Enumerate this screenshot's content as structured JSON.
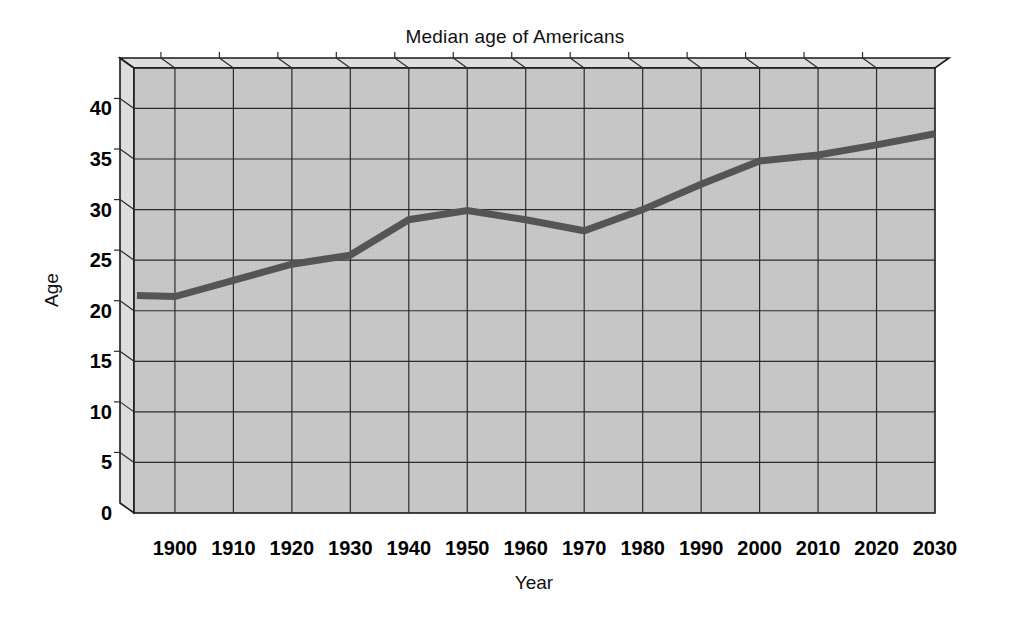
{
  "chart_data": {
    "type": "line",
    "title": "Median age of Americans",
    "xlabel": "Year",
    "ylabel": "Age",
    "categories": [
      1900,
      1910,
      1920,
      1930,
      1940,
      1950,
      1960,
      1970,
      1980,
      1990,
      2000,
      2010,
      2020,
      2030
    ],
    "values": [
      21.4,
      23.0,
      24.6,
      25.5,
      29.0,
      29.9,
      29.0,
      27.9,
      30.0,
      32.5,
      34.8,
      35.4,
      36.4,
      37.5
    ],
    "lead_in": {
      "x": 1893,
      "y": 21.5
    },
    "series": [
      {
        "name": "Median age",
        "values": [
          21.4,
          23.0,
          24.6,
          25.5,
          29.0,
          29.9,
          29.0,
          27.9,
          30.0,
          32.5,
          34.8,
          35.4,
          36.4,
          37.5
        ]
      }
    ],
    "xticklabels": [
      "1900",
      "1910",
      "1920",
      "1930",
      "1940",
      "1950",
      "1960",
      "1970",
      "1980",
      "1990",
      "2000",
      "2010",
      "2020",
      "2030"
    ],
    "yticklabels": [
      "0",
      "5",
      "10",
      "15",
      "20",
      "25",
      "30",
      "35",
      "40"
    ],
    "yticks": [
      0,
      5,
      10,
      15,
      20,
      25,
      30,
      35,
      40
    ],
    "ylim": [
      0,
      44
    ],
    "xlim": [
      1893,
      2030
    ],
    "grid": true,
    "legend": "none",
    "style": "3d-walled-plot-area",
    "colors": {
      "line": "#555555",
      "plot_background": "#c6c6c6",
      "wall_side": "#dcdcdc",
      "wall_top": "#e8e8e8",
      "grid": "#2b2b2b",
      "frame": "#1a1a1a",
      "page_background": "#fefefe",
      "text": "#111111"
    }
  }
}
